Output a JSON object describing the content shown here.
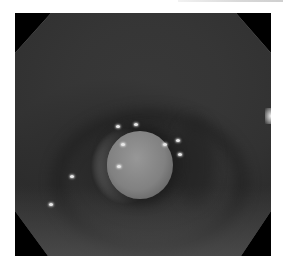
{
  "image": {
    "subject": "endoscopic view of airway lumen with round smooth mass",
    "color_mode": "grayscale",
    "frame_shape": "octagon",
    "colors": {
      "background": "#ffffff",
      "frame": "#000000",
      "mucosa_light": "#c9c9c9",
      "lumen_dark": "#2a2a2a",
      "mass": "#8a8a8a"
    },
    "specular_highlights": 9
  }
}
